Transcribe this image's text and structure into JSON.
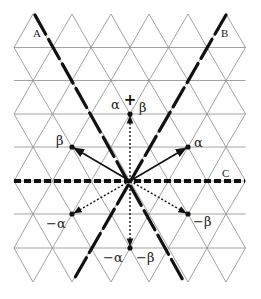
{
  "diagram": {
    "colors": {
      "grid": "#8a8a8a",
      "ink": "#111111",
      "background": "#ffffff"
    },
    "lines": {
      "A": {
        "label": "A",
        "style": "heavy-broken"
      },
      "B": {
        "label": "B",
        "style": "heavy-broken"
      },
      "C": {
        "label": "C",
        "style": "heavy-dashed"
      }
    },
    "plus_marker": "+",
    "vectors": [
      {
        "name": "alpha",
        "label": "α",
        "style": "solid",
        "tip": [
          188,
          147
        ]
      },
      {
        "name": "beta",
        "label": "β",
        "style": "solid",
        "tip": [
          72,
          147
        ]
      },
      {
        "name": "alpha-plus-beta",
        "label_left": "α",
        "label_right": "β",
        "style": "dotted",
        "tip": [
          130,
          114
        ]
      },
      {
        "name": "minus-alpha",
        "label": "−α",
        "style": "dotted",
        "tip": [
          72,
          214
        ]
      },
      {
        "name": "minus-beta",
        "label": "−β",
        "style": "dotted",
        "tip": [
          188,
          214
        ]
      },
      {
        "name": "minus-alpha-minus-beta",
        "label_left": "−α",
        "label_right": "−β",
        "style": "dotted",
        "tip": [
          130,
          248
        ]
      }
    ],
    "origin": [
      130,
      181
    ]
  }
}
